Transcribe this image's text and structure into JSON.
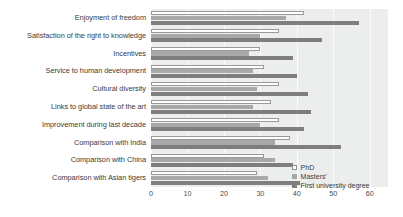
{
  "chart_data": {
    "type": "bar",
    "orientation": "horizontal",
    "title": "",
    "xlabel": "",
    "ylabel": "",
    "xlim": [
      0,
      65
    ],
    "xticks": [
      0,
      10,
      20,
      30,
      40,
      50,
      60
    ],
    "grid": true,
    "legend_position": "bottom-right",
    "categories": [
      "Enjoyment of freedom",
      "Satisfaction of the right to knowledge",
      "Incentives",
      "Service to human development",
      "Cultural diversity",
      "Links to global state of the art",
      "Improvement during last decade",
      "Comparison with India",
      "Comparison with China",
      "Comparison with Asian tigers"
    ],
    "series": [
      {
        "name": "PhD",
        "color": "#fdfdfd",
        "values": [
          42,
          35,
          30,
          31,
          35,
          33,
          35,
          38,
          31,
          29
        ]
      },
      {
        "name": "Masters'",
        "color": "#a8a8a8",
        "values": [
          37,
          30,
          27,
          28,
          29,
          28,
          30,
          34,
          34,
          32
        ]
      },
      {
        "name": "First university degree",
        "color": "#7e7e7e",
        "values": [
          57,
          47,
          39,
          40,
          43,
          44,
          42,
          52,
          39,
          41
        ]
      }
    ]
  },
  "legend": {
    "items": [
      {
        "label": "PhD"
      },
      {
        "label": "Masters'"
      },
      {
        "label": "First university degree"
      }
    ]
  },
  "colors": {
    "plot_background": "#eceded",
    "gridline": "#fbfbfb",
    "text": "#3b3b3b"
  }
}
